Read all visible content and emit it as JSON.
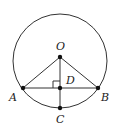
{
  "diagram": {
    "type": "circle-geometry",
    "circle": {
      "cx": 60,
      "cy": 61,
      "r": 47
    },
    "points": {
      "O": {
        "x": 60,
        "y": 57,
        "label": "O",
        "lx": 56,
        "ly": 50
      },
      "D": {
        "x": 60,
        "y": 88,
        "label": "D",
        "lx": 67,
        "ly": 83
      },
      "A": {
        "x": 23,
        "y": 88,
        "label": "A",
        "lx": 9,
        "ly": 101
      },
      "B": {
        "x": 98,
        "y": 88,
        "label": "B",
        "lx": 101,
        "ly": 101
      },
      "C": {
        "x": 60,
        "y": 108,
        "label": "C",
        "lx": 56,
        "ly": 123
      }
    },
    "segments": [
      "OA",
      "OB",
      "AB",
      "OC"
    ],
    "right_angle_at": "D",
    "colors": {
      "stroke": "#333333",
      "point": "#111111",
      "background": "#ffffff"
    }
  }
}
